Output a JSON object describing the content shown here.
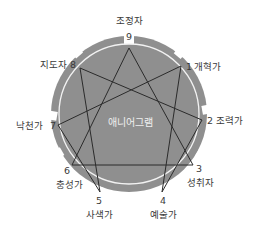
{
  "title": "애니어그램",
  "colors": {
    "disc": "#8f8f8f",
    "inner_ring": "#f2f2f2",
    "lines": "#2b2b2b",
    "text": "#3a3a3a",
    "center_text": "#f0f0f0"
  },
  "points": [
    {
      "number": "9",
      "label": "조정자"
    },
    {
      "number": "1",
      "label": "개혁가"
    },
    {
      "number": "2",
      "label": "조력가"
    },
    {
      "number": "3",
      "label": "성취자"
    },
    {
      "number": "4",
      "label": "예술가"
    },
    {
      "number": "5",
      "label": "사색가"
    },
    {
      "number": "6",
      "label": "충성가"
    },
    {
      "number": "7",
      "label": "낙천가"
    },
    {
      "number": "8",
      "label": "지도자"
    }
  ],
  "connections": {
    "triangle": [
      "9",
      "3",
      "6",
      "9"
    ],
    "hexad": [
      "1",
      "4",
      "2",
      "8",
      "5",
      "7",
      "1"
    ]
  }
}
